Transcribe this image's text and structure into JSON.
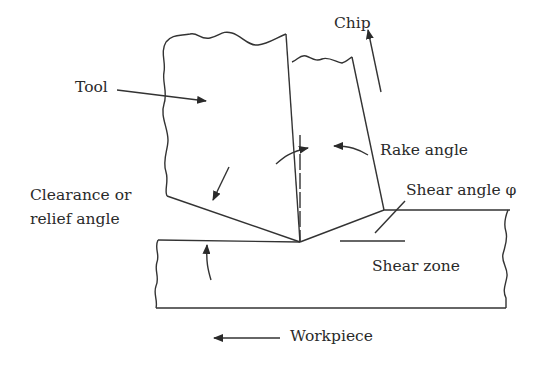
{
  "diagram": {
    "labels": {
      "chip": "Chip",
      "tool": "Tool",
      "rake_angle": "Rake angle",
      "clearance_line1": "Clearance or",
      "clearance_line2": "relief angle",
      "shear_angle": "Shear angle φ",
      "shear_zone": "Shear zone",
      "workpiece": "Workpiece"
    },
    "components": [
      "tool",
      "chip",
      "workpiece",
      "shear zone"
    ],
    "colors": {
      "line": "#333333",
      "text": "#2a2a2a",
      "background": "#ffffff"
    }
  }
}
